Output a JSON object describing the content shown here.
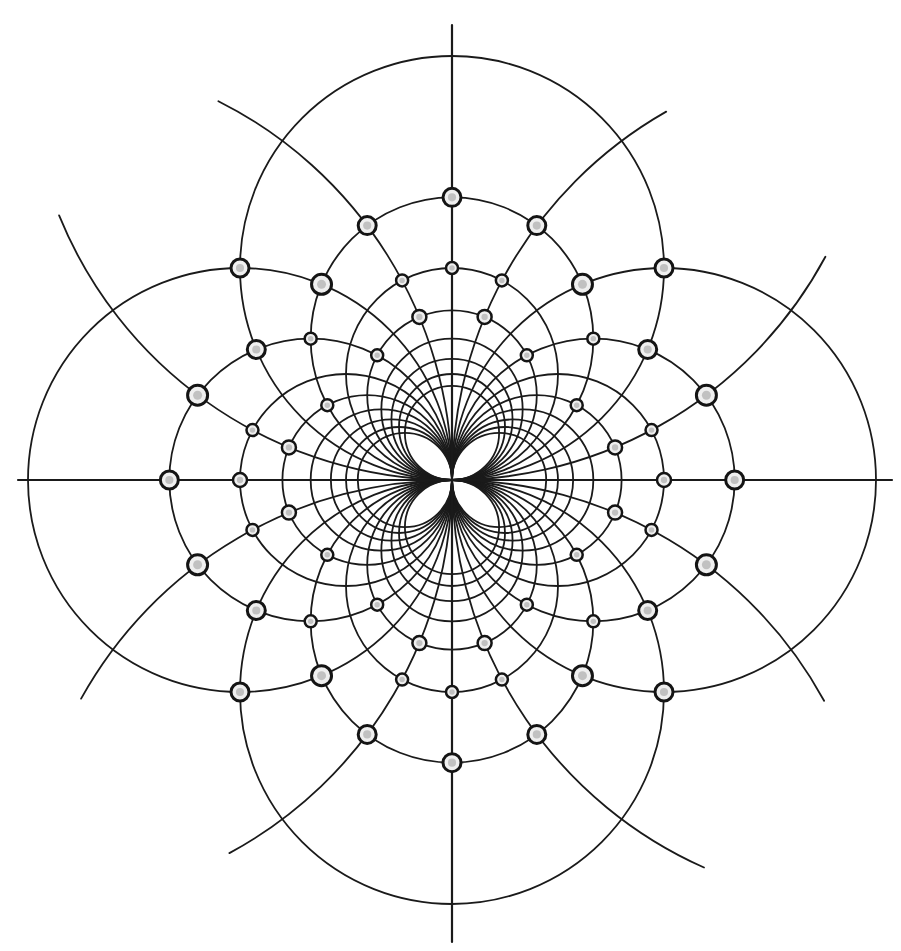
{
  "figure": {
    "title": "",
    "background": "#ffffff",
    "ink_color": "#1a1a1a",
    "bead_fill": "#efefef",
    "origin": [
      452,
      480
    ],
    "unit": 848,
    "axes": {
      "horizontal": {
        "x1": 18,
        "x2": 892,
        "y": 480
      },
      "vertical": {
        "y1": 25,
        "y2": 942,
        "x": 452
      }
    }
  },
  "chart_data": {
    "type": "diagram",
    "title": "",
    "families": [
      {
        "name": "circles centered on vertical axis (tangent to horizontal axis at origin)",
        "index_values": [
          1,
          2,
          3,
          4,
          5,
          6,
          7,
          8,
          9
        ],
        "radius_formula": "424 / n px"
      },
      {
        "name": "circles centered on horizontal axis (tangent to vertical axis at origin)",
        "index_values": [
          1,
          2,
          3,
          4,
          5,
          6,
          7,
          8,
          9
        ],
        "radius_formula": "424 / n px"
      }
    ],
    "radii_px": [
      424,
      212,
      141,
      106,
      85,
      71,
      61,
      53,
      47
    ],
    "clipped_arcs": [
      {
        "family": "V",
        "n": 1,
        "side": "up",
        "end_left": [
          60,
          215
        ],
        "end_right": [
          822,
          255
        ]
      },
      {
        "family": "V",
        "n": 1,
        "side": "down",
        "end_left": [
          80,
          698
        ],
        "end_right": [
          820,
          703
        ]
      },
      {
        "family": "H",
        "n": 1,
        "side": "left",
        "end_top": [
          218,
          102
        ],
        "end_bottom": [
          225,
          845
        ]
      },
      {
        "family": "H",
        "n": 1,
        "side": "right",
        "end_top": [
          667,
          113
        ],
        "end_bottom": [
          706,
          863
        ]
      }
    ],
    "beads_grid_points": [
      {
        "n": 2,
        "m": 2,
        "size": 9
      },
      {
        "n": 1,
        "m": 3,
        "size": 9
      },
      {
        "n": 3,
        "m": 1,
        "size": 10
      },
      {
        "n": 2,
        "m": 3,
        "size": 10
      },
      {
        "n": 3,
        "m": 2,
        "size": 9
      },
      {
        "n": 1,
        "m": 4,
        "size": 6
      },
      {
        "n": 4,
        "m": 1,
        "size": 6
      },
      {
        "n": 3,
        "m": 3,
        "size": 6
      },
      {
        "n": 1,
        "m": 5,
        "size": 7
      },
      {
        "n": 5,
        "m": 1,
        "size": 7
      },
      {
        "n": 3,
        "m": 5,
        "size": 6
      },
      {
        "n": 5,
        "m": 3,
        "size": 6
      },
      {
        "n": 3,
        "m": 0,
        "size": 9
      },
      {
        "n": 4,
        "m": 0,
        "size": 7
      },
      {
        "n": 0,
        "m": 3,
        "size": 9
      },
      {
        "n": 0,
        "m": 4,
        "size": 6
      }
    ],
    "xlim": [
      0,
      901
    ],
    "ylim": [
      0,
      951
    ],
    "grid": false,
    "legend": null
  }
}
